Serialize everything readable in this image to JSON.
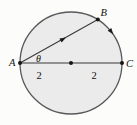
{
  "figure": {
    "labels": {
      "point_a": "A",
      "point_b": "B",
      "point_c": "C",
      "angle_theta": "θ",
      "left_segment_length": "2",
      "right_segment_length": "2"
    },
    "colors": {
      "background": "#fcfcfb",
      "circle_fill": "#ebebeb",
      "circle_stroke": "#58595b",
      "line_stroke": "#3a3a3a",
      "dot_fill": "#151515",
      "arrow_fill": "#1c1c1c",
      "text_color": "#111111"
    }
  }
}
